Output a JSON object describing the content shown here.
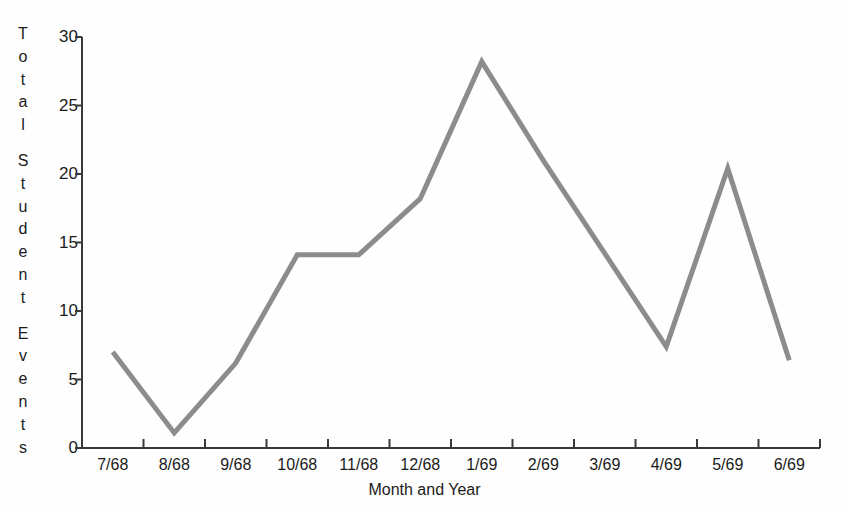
{
  "chart_data": {
    "type": "line",
    "title": "",
    "xlabel": "Month and Year",
    "ylabel": "Total Student Events",
    "categories": [
      "7/68",
      "8/68",
      "9/68",
      "10/68",
      "11/68",
      "12/68",
      "1/69",
      "2/69",
      "3/69",
      "4/69",
      "5/69",
      "6/69"
    ],
    "values": [
      7.0,
      1.1,
      6.2,
      14.1,
      14.1,
      18.2,
      28.2,
      21.0,
      14.2,
      7.4,
      20.4,
      6.4
    ],
    "series": [
      {
        "name": "Total Student Events",
        "values": [
          7.0,
          1.1,
          6.2,
          14.1,
          14.1,
          18.2,
          28.2,
          21.0,
          14.2,
          7.4,
          20.4,
          6.4
        ]
      }
    ],
    "ylim": [
      0,
      30
    ],
    "yticks": [
      0,
      5,
      10,
      15,
      20,
      25,
      30
    ],
    "ytick_labels": [
      "0",
      "5",
      "10",
      "15",
      "20",
      "25",
      "30"
    ],
    "grid": false,
    "legend": "none",
    "line_color": "#8c8c8c",
    "axis_color": "#3a3a3a",
    "background_color": "#fefefe"
  },
  "axis": {
    "y_title_letters": [
      "T",
      "o",
      "t",
      "a",
      "l",
      "",
      "S",
      "t",
      "u",
      "d",
      "e",
      "n",
      "t",
      "",
      "E",
      "v",
      "e",
      "n",
      "t",
      "s"
    ],
    "y_title_text": "Total Student Events",
    "x_title_text": "Month and Year"
  }
}
